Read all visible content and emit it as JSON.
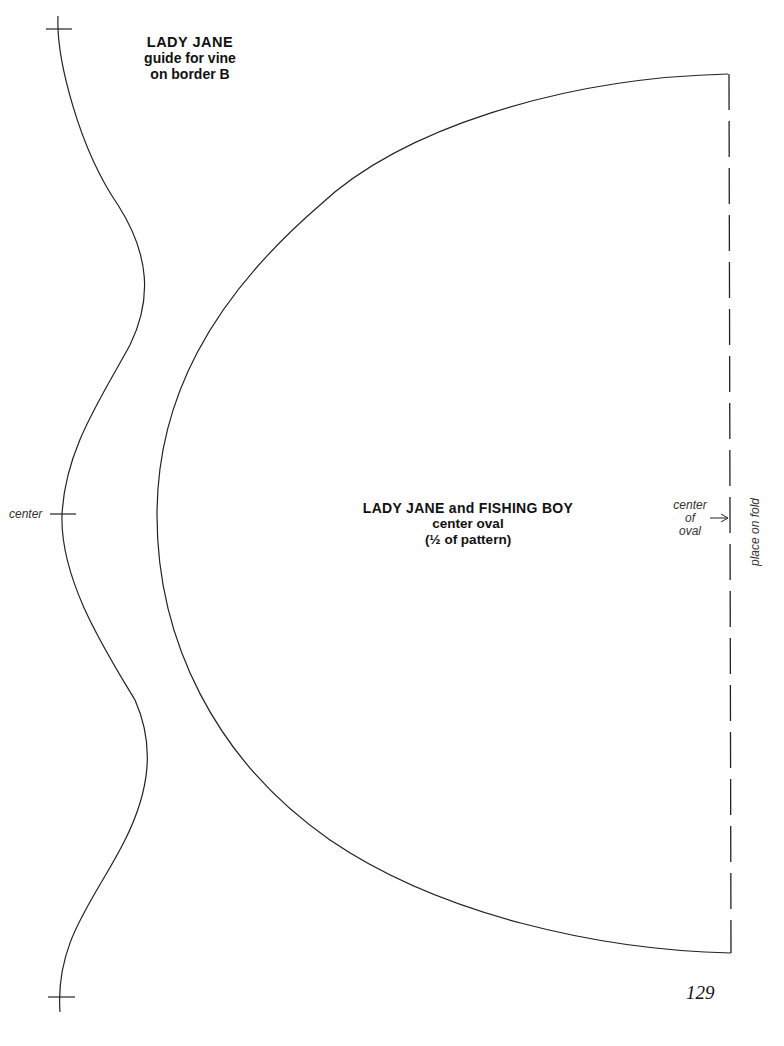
{
  "vine_guide": {
    "title_line1": "LADY JANE",
    "title_line2": "guide for vine",
    "title_line3": "on border B",
    "center_label": "center"
  },
  "oval": {
    "title_line1": "LADY JANE and FISHING BOY",
    "title_line2": "center oval",
    "title_line3": "(½ of pattern)",
    "center_label_line1": "center",
    "center_label_line2": "of",
    "center_label_line3": "oval",
    "fold_label": "place on fold"
  },
  "page": {
    "number": "129"
  },
  "colors": {
    "line": "#222222",
    "background": "#ffffff"
  }
}
